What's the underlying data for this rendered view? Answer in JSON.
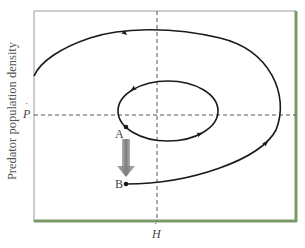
{
  "figure": {
    "y_axis_label": "Predator population density",
    "x_equilibrium_label": "H",
    "y_equilibrium_label": "P",
    "equilibrium_mark": "˙",
    "points": [
      {
        "id": "A",
        "label": "A"
      },
      {
        "id": "B",
        "label": "B"
      }
    ],
    "colors": {
      "curve": "#1a1a1a",
      "dashed_axes": "#555555",
      "frame_top_left": "#9a9a9a",
      "frame_bottom_right": "#7a9a6a",
      "perturbation_arrow": "#8a8a8a",
      "text": "#444444"
    }
  }
}
